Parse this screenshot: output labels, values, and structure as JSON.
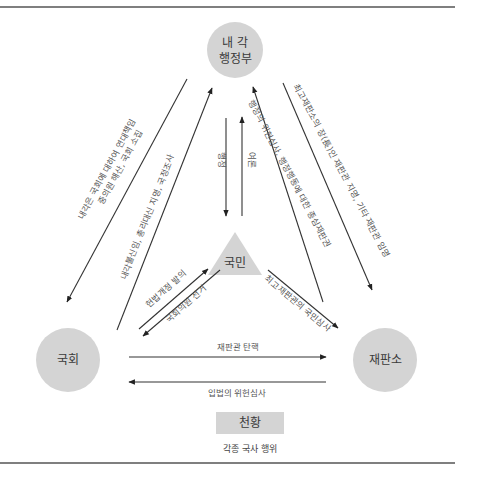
{
  "colors": {
    "node_fill": "#d4d4d4",
    "rule": "#555555",
    "line": "#333333",
    "text": "#3a3a3a"
  },
  "nodes": {
    "cabinet": {
      "line1": "내  각",
      "line2": "행정부",
      "shape": "circle"
    },
    "diet": {
      "label": "국회",
      "shape": "circle"
    },
    "court": {
      "label": "재판소",
      "shape": "circle"
    },
    "people": {
      "label": "국민",
      "shape": "triangle"
    },
    "emperor": {
      "label": "천황",
      "caption": "각종 국사 행위",
      "shape": "rectangle"
    }
  },
  "edges": {
    "cabinet_to_diet": {
      "line1": "내각은 국회에 대하여 연대책임",
      "line2": "중의원 해산, 국회 소집"
    },
    "diet_to_cabinet": {
      "label": "내각불신임, 총리대신 지명, 국정조사"
    },
    "cabinet_to_people": {
      "label": "행정"
    },
    "people_to_cabinet": {
      "label": "여론"
    },
    "court_to_cabinet": {
      "label": "행정의 위헌심사, 행정행동에 대한 종심재판권"
    },
    "cabinet_to_court": {
      "label": "최고재판소의 장(長)인 재판관 지명, 기타 재판관 임명"
    },
    "diet_to_people": {
      "label": "헌법개정 발의"
    },
    "people_to_diet": {
      "label": "국회의원 선거"
    },
    "people_to_court": {
      "label": "최고재판관의 국민심사"
    },
    "diet_to_court": {
      "label": "재판관 탄핵"
    },
    "court_to_diet": {
      "label": "입법의 위헌심사"
    }
  }
}
